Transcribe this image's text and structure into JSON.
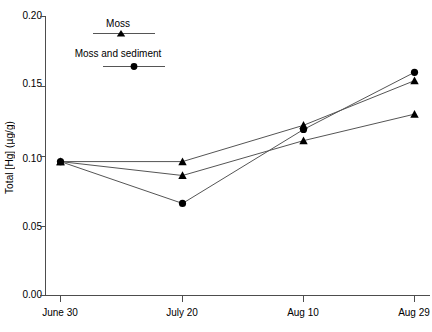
{
  "chart_data": {
    "type": "line",
    "title": "",
    "xlabel": "",
    "ylabel": "Total [Hg] (µg/g)",
    "categories": [
      "June 30",
      "July 20",
      "Aug 10",
      "Aug 29"
    ],
    "x_tick_labels": [
      "June 30",
      "July 20",
      "Aug 10",
      "Aug 29"
    ],
    "y_tick_labels": [
      "0.00",
      "0.05",
      "0.10",
      "0.15",
      "0.20"
    ],
    "y_tick_values": [
      0.0,
      0.05,
      0.1,
      0.15,
      0.2
    ],
    "ylim": [
      0.0,
      0.2
    ],
    "grid": false,
    "legend_position": "top-center-left",
    "series": [
      {
        "name": "Moss",
        "marker": "triangle",
        "color": "#000000",
        "values": [
          0.096,
          0.096,
          0.122,
          0.154
        ]
      },
      {
        "name": "Moss",
        "marker": "triangle",
        "color": "#000000",
        "values": [
          0.096,
          0.086,
          0.111,
          0.13
        ]
      },
      {
        "name": "Moss and sediment",
        "marker": "circle",
        "color": "#000000",
        "values": [
          0.096,
          0.066,
          0.119,
          0.16
        ]
      }
    ],
    "legend": [
      {
        "label": "Moss",
        "marker": "triangle"
      },
      {
        "label": "Moss and sediment",
        "marker": "circle"
      }
    ]
  },
  "axis": {
    "y_label": "Total [Hg] (µg/g)",
    "y_ticks": [
      "0.20",
      "0.15",
      "0.10",
      "0.05",
      "0.00"
    ],
    "x_ticks": [
      "June 30",
      "July 20",
      "Aug 10",
      "Aug 29"
    ]
  },
  "legend": {
    "moss_label": "Moss",
    "moss_sediment_label": "Moss and sediment"
  },
  "colors": {
    "axis": "#4d4d4d",
    "line": "#555555",
    "marker": "#000000",
    "text": "#000000",
    "background": "#ffffff"
  }
}
